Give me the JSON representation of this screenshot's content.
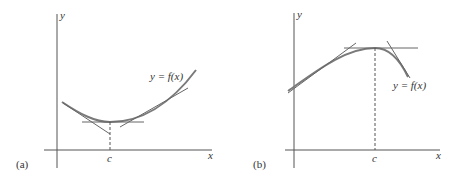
{
  "panels": [
    {
      "id": "a",
      "panel_label": "(a)",
      "y_axis_label": "y",
      "x_axis_label": "x",
      "point_label": "c",
      "curve_label": "y = f(x)",
      "description": "Concave-up curve with local minimum at x = c; horizontal tangent at c, tangent lines on either side"
    },
    {
      "id": "b",
      "panel_label": "(b)",
      "y_axis_label": "y",
      "x_axis_label": "x",
      "point_label": "c",
      "curve_label": "y = f(x)",
      "description": "Concave-down curve with local maximum at x = c; horizontal tangent at c, tangent lines on either side"
    }
  ],
  "colors": {
    "axis": "#555555",
    "curve": "#777777",
    "tangent": "#666666"
  }
}
